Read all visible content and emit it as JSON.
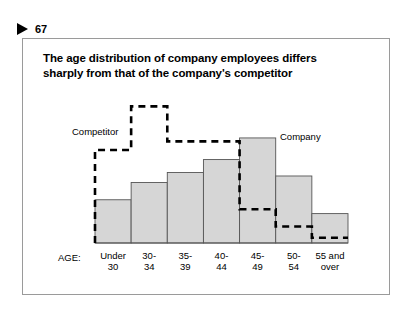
{
  "marker": {
    "icon": "triangle-right-icon",
    "number": "67"
  },
  "title": {
    "line1": "The age distribution of company employees differs",
    "line2": "sharply from that of the company's competitor"
  },
  "legend": {
    "competitor_label": "Competitor",
    "company_label": "Company"
  },
  "axis": {
    "title": "AGE:"
  },
  "colors": {
    "bar_fill": "#d6d6d6",
    "bar_stroke": "#555555",
    "dashed_line": "#000000",
    "frame_border": "#9a9a9a",
    "text": "#000000"
  },
  "chart_data": {
    "type": "bar",
    "title": "The age distribution of company employees differs sharply from that of the company's competitor",
    "xlabel": "AGE:",
    "ylabel": "",
    "grid": false,
    "legend_position": "inline-annotations",
    "categories": [
      "Under 30",
      "30-34",
      "35-39",
      "40-44",
      "45-49",
      "50-54",
      "55 and over"
    ],
    "category_lines": [
      [
        "Under",
        "30"
      ],
      [
        "30-",
        "34"
      ],
      [
        "35-",
        "39"
      ],
      [
        "40-",
        "44"
      ],
      [
        "45-",
        "49"
      ],
      [
        "50-",
        "54"
      ],
      [
        "55 and",
        "over"
      ]
    ],
    "series": [
      {
        "name": "Company",
        "style": "bars",
        "values": [
          10.0,
          14.0,
          16.3,
          19.3,
          24.3,
          15.5,
          6.8
        ]
      },
      {
        "name": "Competitor",
        "style": "dashed-step-outline",
        "values": [
          21.5,
          31.6,
          23.5,
          23.5,
          7.8,
          3.8,
          1.2
        ]
      }
    ],
    "ylim": [
      0,
      34
    ]
  }
}
